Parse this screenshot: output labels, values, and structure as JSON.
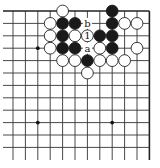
{
  "diagram": {
    "type": "go-board-fragment",
    "grid": {
      "columns": 12,
      "rows": 13,
      "origin_x": 13,
      "origin_y": 11,
      "spacing": 12.4,
      "top_edge": true,
      "right_edge": true,
      "left_open": true,
      "bottom_open": true
    },
    "colors": {
      "line": "#333333",
      "black_stone": "#1a1a1a",
      "white_stone": "#ffffff",
      "background": "#ffffff"
    },
    "star_points": [
      {
        "col": 2,
        "row": 3
      },
      {
        "col": 2,
        "row": 9
      },
      {
        "col": 8,
        "row": 9
      }
    ],
    "stones": [
      {
        "col": 4,
        "row": 0,
        "color": "white"
      },
      {
        "col": 8,
        "row": 0,
        "color": "black"
      },
      {
        "col": 3,
        "row": 1,
        "color": "white"
      },
      {
        "col": 4,
        "row": 1,
        "color": "black"
      },
      {
        "col": 5,
        "row": 1,
        "color": "black"
      },
      {
        "col": 8,
        "row": 1,
        "color": "black"
      },
      {
        "col": 9,
        "row": 1,
        "color": "white"
      },
      {
        "col": 10,
        "row": 1,
        "color": "white"
      },
      {
        "col": 3,
        "row": 2,
        "color": "white"
      },
      {
        "col": 4,
        "row": 2,
        "color": "black"
      },
      {
        "col": 5,
        "row": 2,
        "color": "white"
      },
      {
        "col": 6,
        "row": 2,
        "color": "white",
        "label": "1"
      },
      {
        "col": 7,
        "row": 2,
        "color": "black"
      },
      {
        "col": 8,
        "row": 2,
        "color": "black"
      },
      {
        "col": 3,
        "row": 3,
        "color": "white"
      },
      {
        "col": 4,
        "row": 3,
        "color": "black"
      },
      {
        "col": 5,
        "row": 3,
        "color": "black"
      },
      {
        "col": 7,
        "row": 3,
        "color": "white"
      },
      {
        "col": 8,
        "row": 3,
        "color": "black"
      },
      {
        "col": 10,
        "row": 3,
        "color": "white"
      },
      {
        "col": 4,
        "row": 4,
        "color": "white"
      },
      {
        "col": 5,
        "row": 4,
        "color": "white"
      },
      {
        "col": 6,
        "row": 4,
        "color": "black"
      },
      {
        "col": 7,
        "row": 4,
        "color": "white"
      },
      {
        "col": 8,
        "row": 4,
        "color": "white"
      },
      {
        "col": 9,
        "row": 4,
        "color": "white"
      },
      {
        "col": 6,
        "row": 5,
        "color": "white"
      }
    ],
    "point_labels": [
      {
        "col": 6,
        "row": 1,
        "text": "b"
      },
      {
        "col": 6,
        "row": 3,
        "text": "a"
      }
    ]
  }
}
